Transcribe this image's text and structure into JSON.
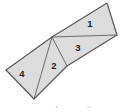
{
  "figure": {
    "name": "tangram-parallelogram",
    "canvas": {
      "width": 123,
      "height": 112
    },
    "colors": {
      "background": "#ffffff",
      "fill": "#dcdcdc",
      "fill_light": "#e2e2e2",
      "outline": "#58585a",
      "inner_line": "#6a6a6c",
      "label": "#1b1b1b",
      "caption": "#b9b9b9"
    },
    "outline_width": 1.2,
    "inner_width": 1.0,
    "vertices": {
      "top_left": [
        52,
        37
      ],
      "top_right": [
        107,
        3
      ],
      "right": [
        117,
        35
      ],
      "apex": [
        52,
        37
      ],
      "mid_right": [
        67,
        66
      ],
      "left": [
        6,
        70
      ],
      "bottom": [
        34,
        99
      ]
    },
    "pieces": [
      {
        "id": "piece-1",
        "label": "1",
        "label_pos": [
          90,
          24
        ],
        "points": "52,37 107,3 117,35",
        "fill": "#dcdcdc"
      },
      {
        "id": "piece-3",
        "label": "3",
        "label_pos": [
          78,
          48
        ],
        "points": "52,37 117,35 67,66",
        "fill": "#dcdcdc"
      },
      {
        "id": "piece-2",
        "label": "2",
        "label_pos": [
          54,
          66
        ],
        "points": "52,37 67,66 34,99",
        "fill": "#dcdcdc"
      },
      {
        "id": "piece-4",
        "label": "4",
        "label_pos": [
          22,
          74
        ],
        "points": "52,37 34,99 6,70",
        "fill": "#dcdcdc"
      }
    ],
    "outer_boundary": "6,70 52,37 107,3 117,35 67,66 34,99 6,70",
    "inner_lines": [
      {
        "name": "apex-to-right-vertex",
        "from": [
          52,
          37
        ],
        "to": [
          117,
          35
        ]
      },
      {
        "name": "apex-to-mid-right",
        "from": [
          52,
          37
        ],
        "to": [
          67,
          66
        ]
      },
      {
        "name": "apex-to-bottom",
        "from": [
          52,
          37
        ],
        "to": [
          34,
          99
        ]
      }
    ],
    "caption": "Area of parallelogram"
  }
}
